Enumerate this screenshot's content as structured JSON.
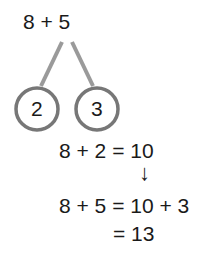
{
  "expression": "8 + 5",
  "bonds": [
    {
      "value": "2"
    },
    {
      "value": "3"
    }
  ],
  "steps": {
    "line1": "8 + 2 = 10",
    "arrow": "↓",
    "line2": "8 + 5 = 10 + 3",
    "line3": "= 13"
  },
  "colors": {
    "circle_stroke": "#777777",
    "line_stroke": "#999999",
    "text": "#1a1a1a"
  }
}
